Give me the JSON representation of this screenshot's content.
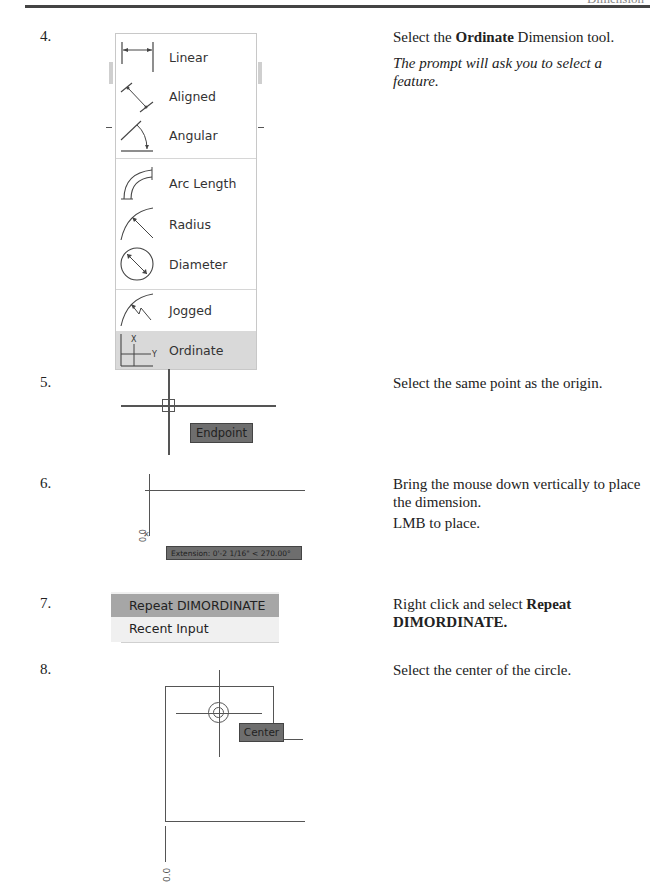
{
  "page": {
    "header_text": "Dimension"
  },
  "steps": [
    {
      "number": "4.",
      "instruction_prefix": "Select the ",
      "instruction_bold": "Ordinate",
      "instruction_suffix": " Dimension tool.",
      "note": "The prompt will ask you to select a feature.",
      "menu": {
        "items": [
          {
            "label": "Linear",
            "icon": "linear-dimension-icon"
          },
          {
            "label": "Aligned",
            "icon": "aligned-dimension-icon"
          },
          {
            "label": "Angular",
            "icon": "angular-dimension-icon"
          },
          {
            "label": "Arc Length",
            "icon": "arc-length-dimension-icon"
          },
          {
            "label": "Radius",
            "icon": "radius-dimension-icon"
          },
          {
            "label": "Diameter",
            "icon": "diameter-dimension-icon"
          },
          {
            "label": "Jogged",
            "icon": "jogged-dimension-icon"
          },
          {
            "label": "Ordinate",
            "icon": "ordinate-dimension-icon",
            "selected": true
          }
        ],
        "ordinate_icon_x": "X",
        "ordinate_icon_y": "Y"
      }
    },
    {
      "number": "5.",
      "instruction": "Select the same point as the origin.",
      "tooltip": "Endpoint"
    },
    {
      "number": "6.",
      "instruction": "Bring the mouse down vertically to place the dimension.",
      "instruction2": "LMB to place.",
      "dimension_text": "0.0",
      "tooltip": "Extension: 0'-2 1/16\" < 270.00°"
    },
    {
      "number": "7.",
      "instruction_prefix": "Right click and select ",
      "instruction_bold": "Repeat DIMORDINATE.",
      "context_menu": [
        {
          "label": "Repeat DIMORDINATE",
          "selected": true
        },
        {
          "label": "Recent Input",
          "selected": false
        }
      ]
    },
    {
      "number": "8.",
      "instruction": "Select the center of the circle.",
      "tooltip": "Center",
      "dimension_text": "0.0"
    }
  ],
  "colors": {
    "menu_selected_bg": "#d9d9d9",
    "tooltip_bg": "#6e6e6e",
    "context_selected_bg": "#a6a6a6"
  }
}
